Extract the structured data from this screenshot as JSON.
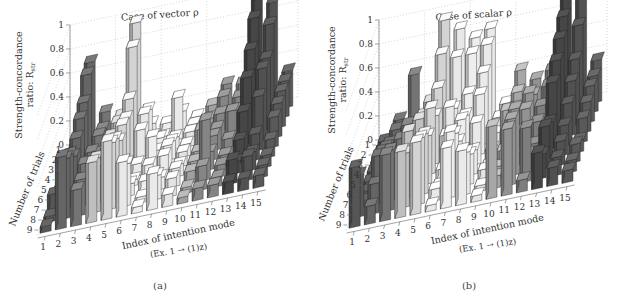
{
  "chart_data": [
    {
      "type": "bar3d",
      "panel_label": "(a)",
      "title": "Case of vector ρ",
      "zlabel_line1": "Strength-concordance",
      "zlabel_line2": "ratio: R_str",
      "ylabel": "Number of trials",
      "xlabel": "Index of intention mode",
      "xlabel_sub": "(Ex. 1 → (1)z)",
      "x_ticks": [
        "1",
        "2",
        "3",
        "4",
        "5",
        "6",
        "7",
        "8",
        "9",
        "10",
        "11",
        "12",
        "13",
        "14",
        "15"
      ],
      "y_ticks": [
        "1",
        "2",
        "3",
        "4",
        "5",
        "6",
        "7",
        "8",
        "9"
      ],
      "z_ticks": [
        "0",
        "0.2",
        "0.4",
        "0.6",
        "0.8",
        "1"
      ],
      "zlim": [
        0,
        1
      ],
      "grid": true,
      "group_separators_after_mode": [
        3,
        6,
        9,
        12
      ],
      "heights_by_trial": [
        [
          0.05,
          0.72,
          0.28,
          0.22,
          0.97,
          0.1,
          0.08,
          0.15,
          0.08,
          0.15,
          0.3,
          0.28,
          0.95,
          0.9,
          0.3
        ],
        [
          0.05,
          0.7,
          0.22,
          0.25,
          0.85,
          0.3,
          0.05,
          0.35,
          0.1,
          0.12,
          0.28,
          0.25,
          0.88,
          0.8,
          0.3
        ],
        [
          0.05,
          0.55,
          0.25,
          0.2,
          0.5,
          0.35,
          0.12,
          0.1,
          0.12,
          0.1,
          0.22,
          0.22,
          0.7,
          0.6,
          0.3
        ],
        [
          0.05,
          0.5,
          0.18,
          0.3,
          0.42,
          0.3,
          0.1,
          0.15,
          0.1,
          0.2,
          0.18,
          0.3,
          0.55,
          0.6,
          0.28
        ],
        [
          0.05,
          0.42,
          0.28,
          0.2,
          0.45,
          0.1,
          0.3,
          0.2,
          0.12,
          0.1,
          0.2,
          0.15,
          0.35,
          0.45,
          0.25
        ],
        [
          0.05,
          0.35,
          0.2,
          0.3,
          0.4,
          0.05,
          0.15,
          0.2,
          0.1,
          0.1,
          0.15,
          0.1,
          0.2,
          0.22,
          0.15
        ],
        [
          0.15,
          0.45,
          0.35,
          0.3,
          0.5,
          0.1,
          0.1,
          0.1,
          0.15,
          0.1,
          0.5,
          0.1,
          0.1,
          0.15,
          0.1
        ],
        [
          0.05,
          0.5,
          0.3,
          0.45,
          0.55,
          0.35,
          0.05,
          0.2,
          0.15,
          0.05,
          0.2,
          0.08,
          0.2,
          0.2,
          0.1
        ],
        [
          0.05,
          0.6,
          0.3,
          0.5,
          0.65,
          0.45,
          0.05,
          0.3,
          0.1,
          0.05,
          0.1,
          0.1,
          0.1,
          0.1,
          0.1
        ]
      ],
      "mode_colors": [
        "#5a5a5a",
        "#6a6a6a",
        "#7a7a7a",
        "#c9c9c9",
        "#dedede",
        "#f4f4f4",
        "#fafafa",
        "#f6f6f6",
        "#f0f0f0",
        "#a8a8a8",
        "#8c8c8c",
        "#8a8a8a",
        "#4a4a4a",
        "#555555",
        "#5e5e5e"
      ]
    },
    {
      "type": "bar3d",
      "panel_label": "(b)",
      "title": "Case of scalar ρ",
      "zlabel_line1": "Strength-concordance",
      "zlabel_line2": "ratio: R_str",
      "ylabel": "Number of trials",
      "xlabel": "Index of intention mode",
      "xlabel_sub": "(Ex. 1 → (1)z)",
      "x_ticks": [
        "1",
        "2",
        "3",
        "4",
        "5",
        "6",
        "7",
        "8",
        "9",
        "10",
        "11",
        "12",
        "13",
        "14",
        "15"
      ],
      "y_ticks": [
        "1",
        "2",
        "3",
        "4",
        "5",
        "6",
        "7",
        "8",
        "9"
      ],
      "z_ticks": [
        "0",
        "0.2",
        "0.4",
        "0.6",
        "0.8",
        "1"
      ],
      "zlim": [
        0,
        1
      ],
      "grid": true,
      "group_separators_after_mode": [
        3,
        6,
        9,
        12
      ],
      "heights_by_trial": [
        [
          0.05,
          0.2,
          0.55,
          0.3,
          0.95,
          0.85,
          0.75,
          0.8,
          0.15,
          0.4,
          0.3,
          0.35,
          0.95,
          0.9,
          0.35
        ],
        [
          0.05,
          0.2,
          0.15,
          0.25,
          0.75,
          0.7,
          0.7,
          0.75,
          0.1,
          0.3,
          0.25,
          0.3,
          0.85,
          0.75,
          0.3
        ],
        [
          0.05,
          0.15,
          0.3,
          0.35,
          0.55,
          0.35,
          0.45,
          0.6,
          0.2,
          0.25,
          0.35,
          0.2,
          0.75,
          0.55,
          0.3
        ],
        [
          0.05,
          0.25,
          0.25,
          0.4,
          0.4,
          0.45,
          0.35,
          0.5,
          0.15,
          0.2,
          0.3,
          0.3,
          0.65,
          0.45,
          0.25
        ],
        [
          0.05,
          0.3,
          0.35,
          0.3,
          0.55,
          0.3,
          0.4,
          0.35,
          0.1,
          0.4,
          0.2,
          0.25,
          0.55,
          0.35,
          0.2
        ],
        [
          0.05,
          0.35,
          0.3,
          0.25,
          0.4,
          0.1,
          0.3,
          0.2,
          0.05,
          0.15,
          0.1,
          0.15,
          0.3,
          0.25,
          0.1
        ],
        [
          0.05,
          0.4,
          0.35,
          0.55,
          0.5,
          0.05,
          0.45,
          0.25,
          0.1,
          0.1,
          0.55,
          0.15,
          0.35,
          0.2,
          0.15
        ],
        [
          0.35,
          0.25,
          0.5,
          0.45,
          0.55,
          0.1,
          0.55,
          0.35,
          0.05,
          0.1,
          0.55,
          0.45,
          0.2,
          0.15,
          0.1
        ],
        [
          0.5,
          0.15,
          0.55,
          0.55,
          0.6,
          0.05,
          0.5,
          0.45,
          0.05,
          0.6,
          0.55,
          0.1,
          0.3,
          0.15,
          0.1
        ]
      ],
      "mode_colors": [
        "#5a5a5a",
        "#6a6a6a",
        "#7a7a7a",
        "#c9c9c9",
        "#dedede",
        "#f4f4f4",
        "#fafafa",
        "#f6f6f6",
        "#f0f0f0",
        "#b0b0b0",
        "#9a9a9a",
        "#858585",
        "#4a4a4a",
        "#555555",
        "#5e5e5e"
      ]
    }
  ]
}
